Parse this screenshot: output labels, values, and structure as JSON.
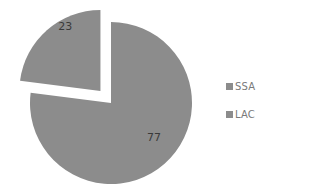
{
  "chart_data": {
    "type": "pie",
    "title": "",
    "categories": [
      "SSA",
      "LAC"
    ],
    "values": [
      77,
      23
    ],
    "data_labels": [
      "77",
      "23"
    ],
    "exploded": [
      "LAC"
    ],
    "colors": [
      "#8c8c8c",
      "#8c8c8c"
    ],
    "legend": {
      "position": "right",
      "entries": [
        {
          "label": "SSA",
          "color": "#8c8c8c"
        },
        {
          "label": "LAC",
          "color": "#8c8c8c"
        }
      ]
    }
  }
}
